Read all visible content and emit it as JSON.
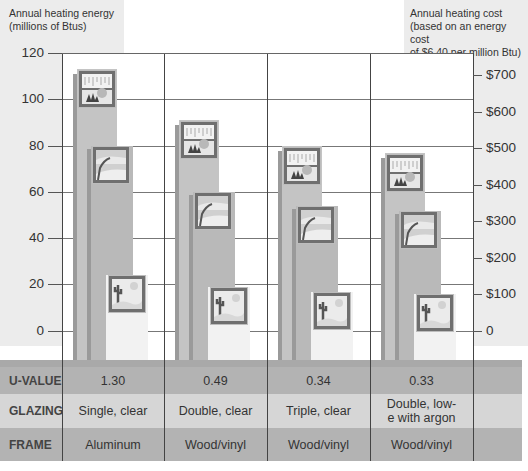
{
  "chart_data": {
    "type": "bar",
    "title": "",
    "ylabel": "Annual heating energy (millions of Btus)",
    "y2label": "Annual heating cost (based on an energy cost of $6.40 per million Btu)",
    "ylim": [
      0,
      120
    ],
    "y2lim": [
      0,
      768
    ],
    "yticks": [
      "0",
      "20",
      "40",
      "60",
      "80",
      "100",
      "120"
    ],
    "y2ticks": [
      "0",
      "$100",
      "$200",
      "$300",
      "$400",
      "$500",
      "$600",
      "$700"
    ],
    "grid": true,
    "categories": [
      "Single, clear / Aluminum (U 1.30)",
      "Double, clear / Wood/vinyl (U 0.49)",
      "Triple, clear / Wood/vinyl (U 0.34)",
      "Double, low-e with argon / Wood/vinyl (U 0.33)"
    ],
    "series": [
      {
        "name": "Cold climate (snowy window icon)",
        "values": [
          113,
          91,
          80,
          77
        ]
      },
      {
        "name": "Temperate climate (tree window icon)",
        "values": [
          80,
          60,
          54,
          52
        ]
      },
      {
        "name": "Hot climate (cactus window icon)",
        "values": [
          24,
          19,
          17,
          16
        ]
      }
    ]
  },
  "axes": {
    "left_title_line1": "Annual heating energy",
    "left_title_line2": "(millions of Btus)",
    "right_title_line1": "Annual heating cost",
    "right_title_line2": "(based on an energy cost",
    "right_title_line3": "of $6.40 per million Btu)",
    "left_ticks": [
      {
        "label": "120",
        "y": 53
      },
      {
        "label": "100",
        "y": 99
      },
      {
        "label": "80",
        "y": 146
      },
      {
        "label": "60",
        "y": 192
      },
      {
        "label": "40",
        "y": 238
      },
      {
        "label": "20",
        "y": 284
      },
      {
        "label": "0",
        "y": 331
      }
    ],
    "right_ticks": [
      {
        "label": "$700",
        "y": 75
      },
      {
        "label": "$600",
        "y": 112
      },
      {
        "label": "$500",
        "y": 148
      },
      {
        "label": "$400",
        "y": 185
      },
      {
        "label": "$300",
        "y": 221
      },
      {
        "label": "$200",
        "y": 258
      },
      {
        "label": "$100",
        "y": 294
      },
      {
        "label": "0",
        "y": 331
      }
    ]
  },
  "table": {
    "rows": [
      {
        "header": "U-VALUE",
        "cells": [
          "1.30",
          "0.49",
          "0.34",
          "0.33"
        ]
      },
      {
        "header": "GLAZING",
        "cells": [
          "Single, clear",
          "Double, clear",
          "Triple, clear",
          "Double, low-e with argon"
        ]
      },
      {
        "header": "FRAME",
        "cells": [
          "Aluminum",
          "Wood/vinyl",
          "Wood/vinyl",
          "Wood/vinyl"
        ]
      }
    ]
  },
  "colors": {
    "panel_bg": "#ececec",
    "bar_cold": "#c4c4c4",
    "bar_mid": "#c4c4c4",
    "bar_warm": "#f2f2f2",
    "table_dark": "#b3b3b3",
    "table_light": "#d6d6d6"
  }
}
